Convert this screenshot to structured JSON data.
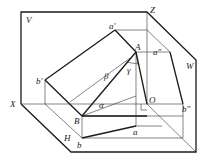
{
  "diagram": {
    "planes": {
      "V": "V",
      "H": "H",
      "W": "W"
    },
    "axes": {
      "X": "X",
      "Z": "Z",
      "origin": "O"
    },
    "points": {
      "A": "A",
      "B": "B",
      "a_prime": "a'",
      "b_prime": "b'",
      "a_dprime": "a″",
      "b_dprime": "b″",
      "a": "a",
      "b": "b"
    },
    "angles": {
      "alpha": "α",
      "beta": "β",
      "gamma": "γ"
    },
    "colors": {
      "line": "#1a1a1a",
      "background": "#ffffff"
    }
  }
}
